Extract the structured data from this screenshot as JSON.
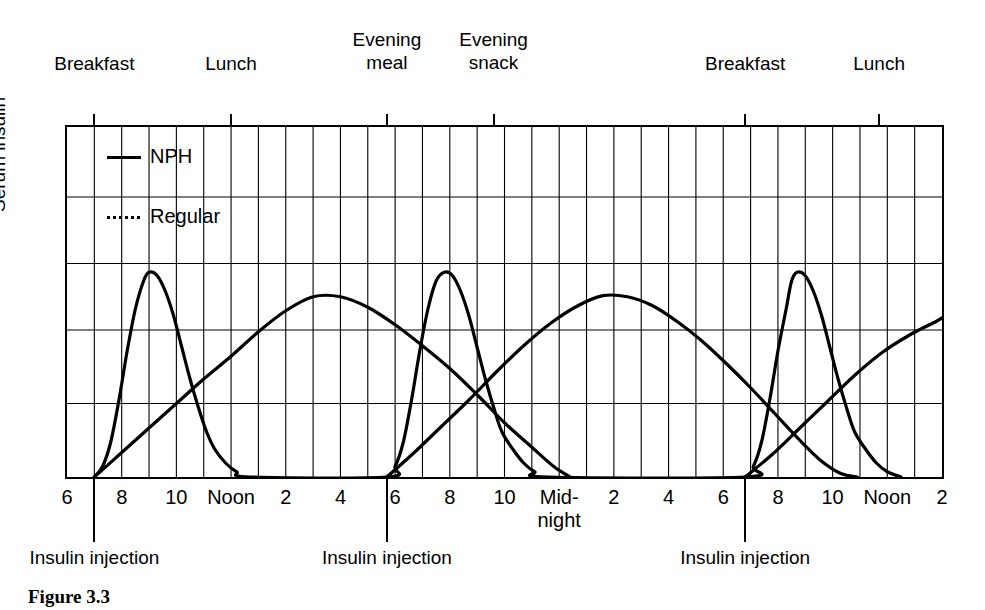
{
  "figure": {
    "caption": "Figure 3.3",
    "ylabel": "Serum insulin"
  },
  "legend": {
    "position": "inside-top-left",
    "items": [
      {
        "label": "NPH",
        "style": "solid",
        "icon": "solid-line-icon"
      },
      {
        "label": "Regular",
        "style": "dashed",
        "icon": "dashed-line-icon"
      }
    ]
  },
  "meals": [
    {
      "label": "Breakfast",
      "hour": 7
    },
    {
      "label": "Lunch",
      "hour": 12
    },
    {
      "label": "Evening\nmeal",
      "hour": 17.7
    },
    {
      "label": "Evening\nsnack",
      "hour": 21.6
    },
    {
      "label": "Breakfast",
      "hour": 30.8
    },
    {
      "label": "Lunch",
      "hour": 35.7
    }
  ],
  "injections": [
    {
      "label": "Insulin injection",
      "hour": 7
    },
    {
      "label": "Insulin injection",
      "hour": 17.7
    },
    {
      "label": "Insulin injection",
      "hour": 30.8
    }
  ],
  "xticks": [
    {
      "label": "6",
      "hour": 6
    },
    {
      "label": "8",
      "hour": 8
    },
    {
      "label": "10",
      "hour": 10
    },
    {
      "label": "Noon",
      "hour": 12
    },
    {
      "label": "2",
      "hour": 14
    },
    {
      "label": "4",
      "hour": 16
    },
    {
      "label": "6",
      "hour": 18
    },
    {
      "label": "8",
      "hour": 20
    },
    {
      "label": "10",
      "hour": 22
    },
    {
      "label": "Mid-\nnight",
      "hour": 24
    },
    {
      "label": "2",
      "hour": 26
    },
    {
      "label": "4",
      "hour": 28
    },
    {
      "label": "6",
      "hour": 30
    },
    {
      "label": "8",
      "hour": 32
    },
    {
      "label": "10",
      "hour": 34
    },
    {
      "label": "Noon",
      "hour": 36
    },
    {
      "label": "2",
      "hour": 38
    }
  ],
  "chart_data": {
    "type": "line",
    "title": "",
    "xlabel": "",
    "ylabel": "Serum insulin",
    "xlim": [
      6,
      38
    ],
    "ylim": [
      0,
      1
    ],
    "grid": true,
    "grid_x_step_hours": 1,
    "grid_y_levels": [
      0.21,
      0.42,
      0.61,
      0.8
    ],
    "legend_position": "inside-top-left",
    "annotations": [
      "Breakfast",
      "Lunch",
      "Evening meal",
      "Evening snack",
      "Breakfast",
      "Lunch",
      "Insulin injection",
      "Insulin injection",
      "Insulin injection"
    ],
    "series": [
      {
        "name": "Regular",
        "style": "dashed",
        "color": "#000000",
        "description": "Short-acting: rapid sharp peak ~2 h after each injection, gone by ~6-7 h",
        "peaks": [
          {
            "hour": 9,
            "value": 0.585
          },
          {
            "hour": 19.8,
            "value": 0.585
          },
          {
            "hour": 32.7,
            "value": 0.585
          }
        ],
        "points": [
          [
            7.0,
            0.0
          ],
          [
            7.3,
            0.03
          ],
          [
            7.6,
            0.1
          ],
          [
            7.9,
            0.22
          ],
          [
            8.2,
            0.36
          ],
          [
            8.5,
            0.48
          ],
          [
            8.8,
            0.56
          ],
          [
            9.0,
            0.585
          ],
          [
            9.3,
            0.575
          ],
          [
            9.6,
            0.53
          ],
          [
            9.9,
            0.46
          ],
          [
            10.2,
            0.37
          ],
          [
            10.5,
            0.28
          ],
          [
            10.8,
            0.2
          ],
          [
            11.1,
            0.13
          ],
          [
            11.4,
            0.08
          ],
          [
            11.8,
            0.04
          ],
          [
            12.2,
            0.015
          ],
          [
            12.7,
            0.0
          ],
          [
            17.7,
            0.0
          ],
          [
            18.0,
            0.03
          ],
          [
            18.3,
            0.1
          ],
          [
            18.6,
            0.22
          ],
          [
            18.9,
            0.36
          ],
          [
            19.2,
            0.48
          ],
          [
            19.5,
            0.56
          ],
          [
            19.8,
            0.585
          ],
          [
            20.1,
            0.575
          ],
          [
            20.4,
            0.53
          ],
          [
            20.7,
            0.46
          ],
          [
            21.0,
            0.37
          ],
          [
            21.3,
            0.28
          ],
          [
            21.6,
            0.2
          ],
          [
            21.9,
            0.13
          ],
          [
            22.3,
            0.08
          ],
          [
            22.7,
            0.04
          ],
          [
            23.1,
            0.015
          ],
          [
            23.6,
            0.0
          ],
          [
            30.8,
            0.0
          ],
          [
            31.1,
            0.03
          ],
          [
            31.4,
            0.1
          ],
          [
            31.7,
            0.22
          ],
          [
            32.0,
            0.36
          ],
          [
            32.3,
            0.48
          ],
          [
            32.5,
            0.56
          ],
          [
            32.7,
            0.585
          ],
          [
            33.0,
            0.575
          ],
          [
            33.3,
            0.53
          ],
          [
            33.6,
            0.46
          ],
          [
            33.9,
            0.37
          ],
          [
            34.2,
            0.28
          ],
          [
            34.5,
            0.2
          ],
          [
            34.8,
            0.13
          ],
          [
            35.2,
            0.08
          ],
          [
            35.6,
            0.04
          ],
          [
            36.0,
            0.015
          ],
          [
            36.5,
            0.0
          ]
        ]
      },
      {
        "name": "NPH",
        "style": "solid",
        "color": "#000000",
        "description": "Intermediate-acting: slow broad peak ~7-8 h after injection, lasting ~16 h",
        "peaks": [
          {
            "hour": 15,
            "value": 0.52
          },
          {
            "hour": 26,
            "value": 0.52
          },
          {
            "hour": 38,
            "value": 0.46
          }
        ],
        "points": [
          [
            7.0,
            0.0
          ],
          [
            8.0,
            0.07
          ],
          [
            9.0,
            0.14
          ],
          [
            10.0,
            0.21
          ],
          [
            11.0,
            0.28
          ],
          [
            12.0,
            0.345
          ],
          [
            13.0,
            0.415
          ],
          [
            14.0,
            0.475
          ],
          [
            15.0,
            0.515
          ],
          [
            16.0,
            0.515
          ],
          [
            17.0,
            0.485
          ],
          [
            18.0,
            0.435
          ],
          [
            19.0,
            0.375
          ],
          [
            20.0,
            0.31
          ],
          [
            21.0,
            0.235
          ],
          [
            22.0,
            0.155
          ],
          [
            23.0,
            0.085
          ],
          [
            23.8,
            0.03
          ],
          [
            24.4,
            0.0
          ],
          [
            17.7,
            0.0
          ],
          [
            18.7,
            0.07
          ],
          [
            19.7,
            0.145
          ],
          [
            20.7,
            0.22
          ],
          [
            21.7,
            0.3
          ],
          [
            22.7,
            0.375
          ],
          [
            23.7,
            0.44
          ],
          [
            24.7,
            0.49
          ],
          [
            25.6,
            0.518
          ],
          [
            26.5,
            0.515
          ],
          [
            27.4,
            0.49
          ],
          [
            28.3,
            0.445
          ],
          [
            29.2,
            0.39
          ],
          [
            30.1,
            0.325
          ],
          [
            31.0,
            0.255
          ],
          [
            31.9,
            0.18
          ],
          [
            32.8,
            0.105
          ],
          [
            33.6,
            0.045
          ],
          [
            34.3,
            0.01
          ],
          [
            34.9,
            0.0
          ],
          [
            30.8,
            0.0
          ],
          [
            31.8,
            0.065
          ],
          [
            32.8,
            0.14
          ],
          [
            33.8,
            0.215
          ],
          [
            34.8,
            0.29
          ],
          [
            35.8,
            0.355
          ],
          [
            36.8,
            0.405
          ],
          [
            37.8,
            0.445
          ],
          [
            38.0,
            0.455
          ]
        ]
      }
    ]
  }
}
